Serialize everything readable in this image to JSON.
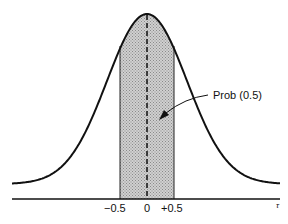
{
  "chart_data": {
    "type": "area",
    "title": "",
    "xlabel": "τ",
    "ylabel": "",
    "tick_labels": [
      "−0.5",
      "0",
      "+0.5"
    ],
    "shaded_interval": [
      -0.5,
      0.5
    ],
    "center_line": 0,
    "annotation": "Prob (0.5)",
    "grid": false
  },
  "labels": {
    "tick_neg": "−0.5",
    "tick_zero": "0",
    "tick_pos": "+0.5",
    "axis_symbol": "τ",
    "annotation": "Prob (0.5)"
  }
}
